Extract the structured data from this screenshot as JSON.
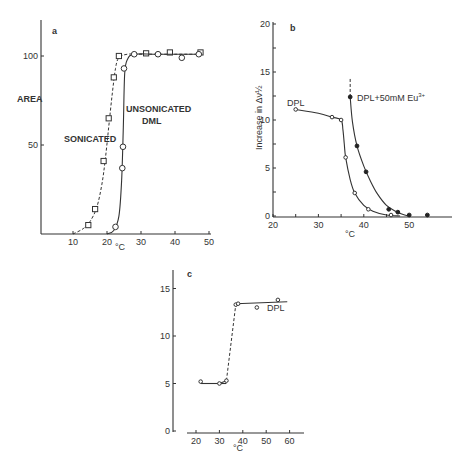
{
  "chart_data": [
    {
      "panel": "a",
      "type": "line",
      "title": "",
      "xlabel": "°C",
      "ylabel": "AREA",
      "xlim": [
        0,
        50
      ],
      "ylim": [
        0,
        120
      ],
      "xticks": [
        10,
        20,
        30,
        40,
        50
      ],
      "yticks": [
        50,
        100
      ],
      "grid": false,
      "series": [
        {
          "name": "SONICATED",
          "marker": "square-open",
          "line": "dashed",
          "x": [
            14.5,
            16.5,
            19,
            20.5,
            22,
            23.5,
            31.5,
            38.5,
            47.5
          ],
          "y": [
            5,
            14,
            41,
            65,
            88,
            100,
            101.5,
            102,
            102
          ],
          "curve_x": [
            10,
            13,
            15,
            17,
            18.5,
            19.5,
            20.5,
            21.5,
            22.5,
            23.5,
            26,
            30,
            40,
            48
          ],
          "curve_y": [
            0,
            3,
            7,
            15,
            28,
            42,
            60,
            78,
            93,
            99,
            101,
            101,
            101,
            101
          ]
        },
        {
          "name": "UNSONICATED DML",
          "marker": "circle-open",
          "line": "solid",
          "x": [
            22.5,
            24.5,
            24.7,
            25,
            28,
            35,
            42,
            47
          ],
          "y": [
            4,
            37,
            49,
            93,
            101,
            101,
            99,
            101
          ],
          "curve_x": [
            20,
            22,
            23.5,
            24.3,
            24.8,
            25.2,
            26,
            28,
            35,
            48
          ],
          "curve_y": [
            0,
            2,
            10,
            30,
            60,
            90,
            98,
            101,
            101,
            101
          ]
        }
      ],
      "annotations": [
        "a",
        "SONICATED",
        "UNSONICATED",
        "DML"
      ]
    },
    {
      "panel": "b",
      "type": "line",
      "title": "",
      "xlabel": "°C",
      "ylabel": "Increase in Δν½",
      "xlim": [
        20,
        57
      ],
      "ylim": [
        0,
        20
      ],
      "xticks": [
        20,
        25,
        30,
        35,
        40,
        45,
        50
      ],
      "xtick_labels": [
        "20",
        "",
        "30",
        "",
        "40",
        "",
        "50"
      ],
      "yticks": [
        0,
        2.5,
        5,
        7.5,
        10,
        12.5,
        15,
        17.5,
        20
      ],
      "ytick_labels": [
        "0",
        "",
        "5",
        "",
        "10",
        "",
        "15",
        "",
        "20"
      ],
      "grid": false,
      "series": [
        {
          "name": "DPL",
          "marker": "circle-open",
          "line": "solid",
          "x": [
            25,
            33,
            35,
            36,
            38,
            41,
            46
          ],
          "y": [
            11.1,
            10.3,
            10.0,
            6.1,
            2.4,
            0.7,
            0.1
          ],
          "curve_x": [
            25,
            30,
            33,
            35,
            35.4,
            35.7,
            36,
            37,
            38,
            40,
            42,
            45,
            48
          ],
          "curve_y": [
            11.1,
            10.7,
            10.3,
            10.0,
            9.0,
            7.5,
            6.1,
            3.8,
            2.4,
            1.1,
            0.5,
            0.1,
            0
          ]
        },
        {
          "name": "DPL+50mM Eu³⁺",
          "marker": "circle-filled",
          "line": "solid",
          "x": [
            37,
            38.5,
            40.5,
            45.5,
            47.5,
            50,
            54
          ],
          "y": [
            12.4,
            7.3,
            4.6,
            0.7,
            0.4,
            0.1,
            0.1
          ],
          "curve_x": [
            37,
            37.5,
            38.5,
            40,
            41.5,
            43,
            45,
            47,
            49,
            50
          ],
          "curve_y": [
            12.4,
            9.8,
            7.3,
            5.2,
            3.6,
            2.3,
            1.1,
            0.5,
            0.1,
            0
          ],
          "dotted_extension": {
            "x": [
              37,
              37
            ],
            "y": [
              12.4,
              14.4
            ]
          }
        }
      ],
      "annotations": [
        "b",
        "DPL",
        "DPL+50mM Eu³⁺"
      ]
    },
    {
      "panel": "c",
      "type": "line",
      "title": "",
      "xlabel": "°C",
      "ylabel": "",
      "xlim": [
        17,
        65
      ],
      "ylim": [
        0,
        17
      ],
      "xticks": [
        20,
        30,
        40,
        50,
        60
      ],
      "yticks": [
        0,
        5,
        10,
        15
      ],
      "grid": false,
      "series": [
        {
          "name": "DPL",
          "marker": "circle-open",
          "x": [
            22,
            30,
            33,
            37,
            38,
            46,
            55
          ],
          "y": [
            5.2,
            5.0,
            5.3,
            13.3,
            13.4,
            13.0,
            13.8
          ],
          "segments": [
            {
              "style": "solid",
              "x": [
                22,
                33
              ],
              "y": [
                5.0,
                5.0
              ]
            },
            {
              "style": "solid",
              "x": [
                30,
                33
              ],
              "y": [
                5.0,
                5.3
              ]
            },
            {
              "style": "dashed",
              "x": [
                33,
                37
              ],
              "y": [
                5.3,
                13.3
              ]
            },
            {
              "style": "solid",
              "x": [
                37,
                59
              ],
              "y": [
                13.4,
                13.6
              ]
            }
          ]
        }
      ],
      "annotations": [
        "c",
        "DPL"
      ]
    }
  ],
  "panels": {
    "a": {
      "letter": "a",
      "ylabel": "AREA",
      "xlabel": "°C",
      "label_sonicated": "SONICATED",
      "label_unsonicated_1": "UNSONICATED",
      "label_unsonicated_2": "DML",
      "yticks": [
        "50",
        "100"
      ],
      "xticks": [
        "10",
        "20",
        "30",
        "40",
        "50"
      ]
    },
    "b": {
      "letter": "b",
      "ylabel": "Increase in Δν½",
      "xlabel": "°C",
      "label_dpl": "DPL",
      "label_eu": "DPL+50mM Eu",
      "label_eu_sup": "3+",
      "yticks": [
        "0",
        "5",
        "10",
        "15",
        "20"
      ],
      "xticks": [
        "20",
        "30",
        "40",
        "50"
      ]
    },
    "c": {
      "letter": "c",
      "xlabel": "°C",
      "label_dpl": "DPL",
      "yticks": [
        "0",
        "5",
        "10",
        "15"
      ],
      "xticks": [
        "20",
        "30",
        "40",
        "50",
        "60"
      ]
    }
  }
}
